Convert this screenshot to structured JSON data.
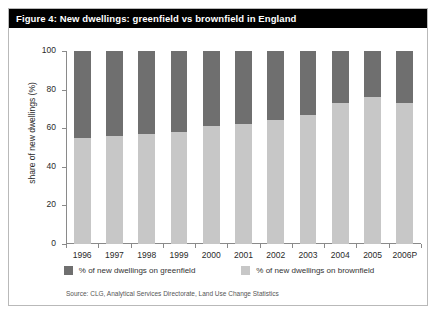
{
  "figure": {
    "title": "Figure 4: New dwellings: greenfield vs brownfield in England",
    "source": "Source: CLG, Analytical Services Directorate, Land Use Change Statistics"
  },
  "colors": {
    "brownfield": "#c7c7c7",
    "greenfield": "#6f6f6f",
    "title_bar": "#000000",
    "title_text": "#ffffff",
    "axis": "#8a8a8a",
    "frame_border": "#b9b9b9"
  },
  "chart_data": {
    "type": "bar",
    "stacked": true,
    "title": "Figure 4: New dwellings: greenfield vs brownfield in England",
    "xlabel": "",
    "ylabel": "share of new dwellings (%)",
    "ylim": [
      0,
      100
    ],
    "yticks": [
      0,
      20,
      40,
      60,
      80,
      100
    ],
    "grid": false,
    "legend_position": "bottom",
    "categories": [
      "1996",
      "1997",
      "1998",
      "1999",
      "2000",
      "2001",
      "2002",
      "2003",
      "2004",
      "2005",
      "2006P"
    ],
    "series": [
      {
        "name": "% of new dwellings on brownfield",
        "color": "#c7c7c7",
        "values": [
          55,
          56,
          57,
          58,
          61,
          62,
          64,
          67,
          73,
          76,
          73
        ]
      },
      {
        "name": "% of new dwellings on greenfield",
        "color": "#6f6f6f",
        "values": [
          45,
          44,
          43,
          42,
          39,
          38,
          36,
          33,
          27,
          24,
          27
        ]
      }
    ]
  }
}
